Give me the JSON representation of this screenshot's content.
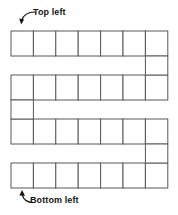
{
  "figure": {
    "type": "serpentine-grid-path",
    "background_color": "#ffffff",
    "line_color": "#58585a",
    "cell_fill": "#ffffff",
    "label_color": "#141414"
  },
  "annotations": [
    {
      "id": "top-left",
      "text": "Top left",
      "arrow": "curved-arrow-down-left",
      "points_to": "first-cell-of-row-1"
    },
    {
      "id": "bottom-left",
      "text": "Bottom left",
      "arrow": "curved-arrow-up-left",
      "points_to": "first-cell-of-row-4"
    }
  ],
  "grid": {
    "rows": 4,
    "cells_per_row": 7,
    "cell_width": 22.4,
    "cell_height": 25,
    "origin_x": 11,
    "row_tops": [
      31,
      75,
      119,
      163
    ],
    "connectors": [
      {
        "side": "right",
        "from_row": 1,
        "to_row": 2
      },
      {
        "side": "left",
        "from_row": 2,
        "to_row": 3
      },
      {
        "side": "right",
        "from_row": 3,
        "to_row": 4
      }
    ],
    "rows_data": [
      {
        "index": 1,
        "label": "row-1",
        "cells": [
          "",
          "",
          "",
          "",
          "",
          "",
          ""
        ]
      },
      {
        "index": 2,
        "label": "row-2",
        "cells": [
          "",
          "",
          "",
          "",
          "",
          "",
          ""
        ]
      },
      {
        "index": 3,
        "label": "row-3",
        "cells": [
          "",
          "",
          "",
          "",
          "",
          "",
          ""
        ]
      },
      {
        "index": 4,
        "label": "row-4",
        "cells": [
          "",
          "",
          "",
          "",
          "",
          "",
          ""
        ]
      }
    ]
  }
}
